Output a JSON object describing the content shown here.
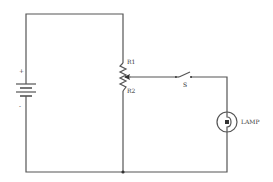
{
  "diagram": {
    "type": "circuit-schematic",
    "labels": {
      "battery_plus": "+",
      "battery_minus": "-",
      "r1": "R1",
      "r2": "R2",
      "switch": "S",
      "lamp": "LAMP"
    },
    "components": [
      {
        "id": "battery",
        "kind": "battery",
        "label_plus": "+",
        "label_minus": "-"
      },
      {
        "id": "potentiometer",
        "kind": "variable-resistor",
        "segments": [
          "R1",
          "R2"
        ]
      },
      {
        "id": "switch",
        "kind": "spst-switch",
        "label": "S",
        "state": "open"
      },
      {
        "id": "lamp",
        "kind": "lamp",
        "label": "LAMP"
      }
    ],
    "colors": {
      "wire": "#555555",
      "background": "#ffffff",
      "text": "#333333"
    }
  }
}
